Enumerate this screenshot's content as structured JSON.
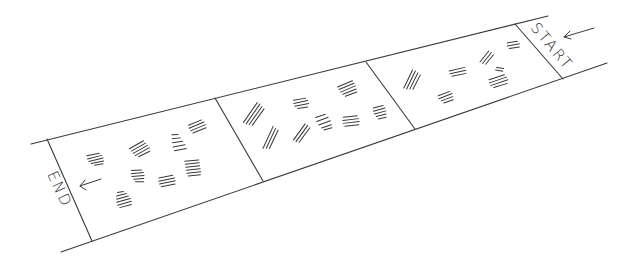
{
  "diagram": {
    "type": "path-with-footprints",
    "labels": {
      "start": "START",
      "end": "END"
    },
    "direction_arrows": [
      {
        "near": "START",
        "direction": "left"
      },
      {
        "near": "END",
        "direction": "left"
      }
    ],
    "sections": [
      {
        "name": "section-1-end",
        "mark_count": 9
      },
      {
        "name": "section-2-middle",
        "mark_count": 9
      },
      {
        "name": "section-3-start",
        "mark_count": 6
      }
    ],
    "colors": {
      "background": "#ffffff",
      "ink": "#2a2a2a"
    }
  }
}
